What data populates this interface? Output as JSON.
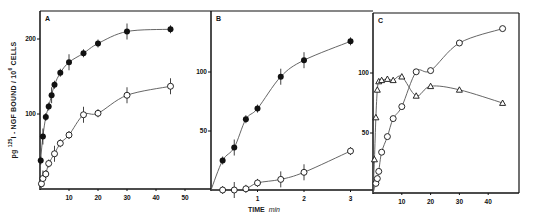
{
  "figure": {
    "ylabel_prefix": "pg ",
    "ylabel_sup1": "125",
    "ylabel_mid": "I - NGF BOUND / 10",
    "ylabel_sup2": "6",
    "ylabel_suffix": " CELLS",
    "xlabel_main": "TIME",
    "xlabel_unit": "min",
    "line_color": "#555555",
    "marker_color": "#111111",
    "frame_color": "#111111"
  },
  "chart_data": [
    {
      "type": "line",
      "panel": "A",
      "title": "A",
      "xlabel": "",
      "ylabel": "pg 125I-NGF BOUND / 10^6 CELLS",
      "xlim": [
        0,
        55
      ],
      "ylim": [
        0,
        230
      ],
      "xticks": [
        10,
        20,
        30,
        40,
        50
      ],
      "yticks": [
        100,
        200
      ],
      "grid": false,
      "series": [
        {
          "name": "filled circles",
          "marker": "filled-circle",
          "x": [
            0.25,
            1,
            2,
            3,
            4,
            5,
            7,
            10,
            15,
            20,
            30,
            45
          ],
          "values": [
            38,
            70,
            96,
            110,
            125,
            139,
            155,
            169,
            181,
            194,
            210,
            213
          ],
          "error_bars": true
        },
        {
          "name": "open circles",
          "marker": "open-circle",
          "x": [
            0.5,
            1,
            2,
            3,
            5,
            7,
            10,
            15,
            20,
            30,
            45
          ],
          "values": [
            7,
            14,
            20,
            34,
            47,
            61,
            72,
            99,
            101,
            125,
            137
          ],
          "error_bars": true
        }
      ]
    },
    {
      "type": "line",
      "panel": "B",
      "title": "B",
      "xlabel": "TIME min",
      "ylabel": "",
      "xlim": [
        0,
        3.4
      ],
      "ylim": [
        0,
        150
      ],
      "xticks": [
        1,
        2,
        3
      ],
      "yticks": [
        50,
        100
      ],
      "grid": false,
      "series": [
        {
          "name": "filled circles",
          "marker": "filled-circle",
          "x": [
            0.25,
            0.5,
            0.75,
            1,
            1.5,
            2,
            3
          ],
          "values": [
            25,
            36,
            60,
            69,
            96,
            110,
            126
          ],
          "error_bars": true
        },
        {
          "name": "open circles",
          "marker": "open-circle",
          "x": [
            0.25,
            0.5,
            0.75,
            1,
            1.5,
            2,
            3
          ],
          "values": [
            0,
            0,
            1,
            6,
            9,
            15,
            33
          ],
          "error_bars": true
        }
      ]
    },
    {
      "type": "line",
      "panel": "C",
      "title": "C",
      "xlabel": "",
      "ylabel": "",
      "xlim": [
        0,
        50
      ],
      "ylim": [
        0,
        150
      ],
      "xticks": [
        10,
        20,
        30,
        40
      ],
      "yticks": [
        50,
        100
      ],
      "grid": false,
      "series": [
        {
          "name": "open triangles",
          "marker": "open-triangle",
          "x": [
            0.5,
            1,
            1.5,
            2,
            3,
            5,
            7,
            10,
            15,
            20,
            30,
            45
          ],
          "values": [
            28,
            63,
            86,
            93,
            94,
            95,
            94,
            97,
            81,
            89,
            86,
            75
          ]
        },
        {
          "name": "open circles",
          "marker": "open-circle",
          "x": [
            1,
            1.5,
            2,
            3,
            5,
            7,
            10,
            15,
            20,
            30,
            45
          ],
          "values": [
            8,
            12,
            18,
            34,
            47,
            62,
            72,
            101,
            102,
            125,
            137
          ]
        }
      ]
    }
  ]
}
